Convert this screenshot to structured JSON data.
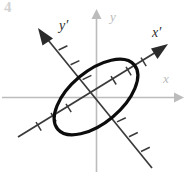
{
  "figure": {
    "width": 187,
    "height": 174,
    "background_color": "#ffffff",
    "corner_artifact_text": "4"
  },
  "colors": {
    "standard_axis": "#bcbcbc",
    "rotated_axis": "#3a3a3a",
    "curve": "#0d0d0d",
    "label_standard": "#b9b9b9",
    "label_rotated": "#2e2e2e"
  },
  "origin": {
    "x": 96,
    "y": 97
  },
  "labels": {
    "x_axis": "x",
    "y_axis": "y",
    "x_prime_axis": "x′",
    "y_prime_axis": "y′"
  },
  "chart_data": {
    "type": "scatter",
    "xlabel": "x",
    "ylabel": "y",
    "grid": false,
    "legend": null,
    "axes": [
      {
        "name": "x",
        "kind": "standard",
        "orientation": "horizontal",
        "angle_deg": 0,
        "color": "#bcbcbc",
        "arrowheads": [
          "positive"
        ],
        "label": "x",
        "label_position": {
          "x": 163,
          "y": 80
        },
        "ticks": 0
      },
      {
        "name": "y",
        "kind": "standard",
        "orientation": "vertical",
        "angle_deg": 90,
        "color": "#bcbcbc",
        "arrowheads": [
          "positive"
        ],
        "label": "y",
        "label_position": {
          "x": 110,
          "y": 18
        },
        "ticks": 0
      },
      {
        "name": "x-prime",
        "kind": "rotated",
        "angle_deg": 27,
        "color": "#3a3a3a",
        "arrowheads": [
          "positive"
        ],
        "label": "x′",
        "label_position": {
          "x": 152,
          "y": 34
        },
        "ticks": 6,
        "tick_spacing_px": 17
      },
      {
        "name": "y-prime",
        "kind": "rotated",
        "angle_deg": 117,
        "color": "#3a3a3a",
        "arrowheads": [
          "positive"
        ],
        "label": "y′",
        "label_position": {
          "x": 59,
          "y": 27
        },
        "ticks": 6,
        "tick_spacing_px": 17
      }
    ],
    "curves": [
      {
        "name": "ellipse",
        "shape": "ellipse",
        "center": {
          "x": 96,
          "y": 97
        },
        "semi_major_px": 50,
        "semi_minor_px": 26,
        "rotation_deg": -40,
        "stroke_color": "#0d0d0d",
        "stroke_width_px": 3.2,
        "fill": "none",
        "note": "Ellipse axes aligned with the rotated x′y′ frame"
      }
    ]
  }
}
